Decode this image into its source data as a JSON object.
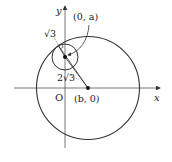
{
  "diagram": {
    "axes": {
      "x_label": "x",
      "y_label": "y",
      "origin_label": "O"
    },
    "large_circle": {
      "center_label": "(b, 0)"
    },
    "small_circle": {
      "center_label": "(0, a)",
      "radius_label": "√3"
    },
    "distance_label": "2√3",
    "colors": {
      "stroke": "#333333",
      "axis": "#555555",
      "background": "#ffffff"
    }
  }
}
